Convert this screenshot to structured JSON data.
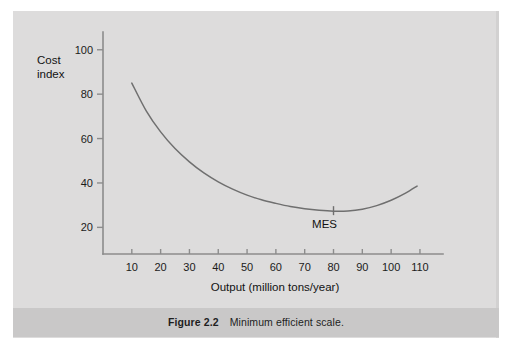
{
  "figure": {
    "caption_label": "Figure 2.2",
    "caption_text": "Minimum efficient scale.",
    "panel_bg": "#dddcdc",
    "caption_bg": "#c9c8c8",
    "page_bg": "#ffffff"
  },
  "chart_data": {
    "type": "line",
    "title": "",
    "xlabel": "Output (million tons/year)",
    "ylabel": "Cost index",
    "ylabel_line1": "Cost",
    "ylabel_line2": "index",
    "xlim": [
      0,
      118
    ],
    "ylim": [
      8,
      108
    ],
    "xticks": [
      10,
      20,
      30,
      40,
      50,
      60,
      70,
      80,
      90,
      100,
      110
    ],
    "xtick_labels": [
      "10",
      "20",
      "30",
      "40",
      "50",
      "60",
      "70",
      "80",
      "90",
      "100",
      "110"
    ],
    "yticks": [
      20,
      40,
      60,
      80,
      100
    ],
    "ytick_labels": [
      "20",
      "40",
      "60",
      "80",
      "100"
    ],
    "grid": false,
    "legend": false,
    "line_color": "#6f6f6f",
    "axis_color": "#8c8c8c",
    "series": [
      {
        "name": "Long-run average cost",
        "x": [
          10,
          15,
          20,
          25,
          30,
          35,
          40,
          45,
          50,
          55,
          60,
          65,
          70,
          75,
          80,
          85,
          90,
          95,
          100,
          105,
          109
        ],
        "y": [
          85.0,
          72.5,
          63.0,
          55.5,
          49.5,
          44.5,
          40.5,
          37.2,
          34.5,
          32.4,
          30.8,
          29.4,
          28.4,
          27.7,
          27.3,
          27.4,
          28.2,
          29.8,
          32.2,
          35.4,
          38.6
        ]
      }
    ],
    "annotations": [
      {
        "name": "mes-marker",
        "label": "MES",
        "x": 80,
        "y": 27.3,
        "marker": "vertical-tick",
        "label_offset_x": -9,
        "label_offset_y": 17
      }
    ]
  }
}
